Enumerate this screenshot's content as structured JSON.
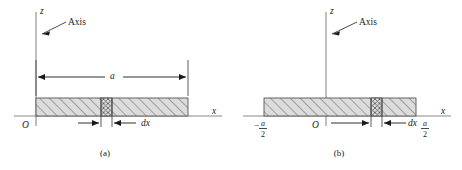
{
  "figure": {
    "kind": "physics-diagram",
    "background_color": "#ffffff",
    "ink_color": "#1a1a1a",
    "axis_color": "#8a8a8a",
    "slab_fill_color": "#d9d9d9",
    "slab_edge_color": "#555555"
  },
  "panels": [
    {
      "id": "a",
      "caption": "(a)",
      "vertical_axis_label": "z",
      "horizontal_axis_label": "x",
      "origin_label": "O",
      "axis_callout": "Axis",
      "dimension_label": "a",
      "element_label": "dx",
      "rod_extent": {
        "from": "O",
        "to": "a"
      }
    },
    {
      "id": "b",
      "caption": "(b)",
      "vertical_axis_label": "z",
      "horizontal_axis_label": "x",
      "origin_label": "O",
      "axis_callout": "Axis",
      "element_label": "dx",
      "left_end_label": {
        "sign": "−",
        "numerator": "a",
        "denominator": "2"
      },
      "right_end_label": {
        "sign": "",
        "numerator": "a",
        "denominator": "2"
      },
      "rod_extent": {
        "from": "-a/2",
        "to": "a/2"
      }
    }
  ]
}
